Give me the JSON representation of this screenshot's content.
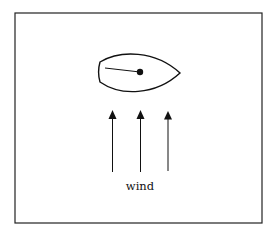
{
  "diagram": {
    "type": "sailboat-wind-illustration",
    "boat": {
      "shape": "hull-top-view",
      "mast": "dot",
      "boom": "line"
    },
    "arrows": {
      "count": 3,
      "direction": "up"
    },
    "label": "wind",
    "colors": {
      "stroke": "#111111",
      "background": "#ffffff"
    }
  }
}
